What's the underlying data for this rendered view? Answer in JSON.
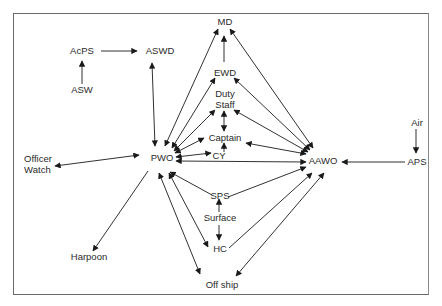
{
  "diagram": {
    "type": "communication-network",
    "nodes": [
      {
        "id": "MD",
        "label": "MD",
        "x": 225,
        "y": 22
      },
      {
        "id": "AcPS",
        "label": "AcPS",
        "x": 82,
        "y": 51
      },
      {
        "id": "ASWD",
        "label": "ASWD",
        "x": 160,
        "y": 51
      },
      {
        "id": "ASW",
        "label": "ASW",
        "x": 82,
        "y": 90
      },
      {
        "id": "EWD",
        "label": "EWD",
        "x": 225,
        "y": 73
      },
      {
        "id": "DutyStaff",
        "label": "Duty\nStaff",
        "x": 225,
        "y": 99
      },
      {
        "id": "Captain",
        "label": "Captain",
        "x": 225,
        "y": 137
      },
      {
        "id": "CY",
        "label": "CY",
        "x": 219,
        "y": 156
      },
      {
        "id": "PWO",
        "label": "PWO",
        "x": 162,
        "y": 157
      },
      {
        "id": "OfficerWatch",
        "label": "Officer\nWatch",
        "x": 36,
        "y": 165
      },
      {
        "id": "AAWO",
        "label": "AAWO",
        "x": 322,
        "y": 160
      },
      {
        "id": "Air",
        "label": "Air",
        "x": 417,
        "y": 123
      },
      {
        "id": "APS",
        "label": "APS",
        "x": 417,
        "y": 161
      },
      {
        "id": "SPS",
        "label": "SPS",
        "x": 220,
        "y": 195
      },
      {
        "id": "Surface",
        "label": "Surface",
        "x": 220,
        "y": 218
      },
      {
        "id": "HC",
        "label": "HC",
        "x": 220,
        "y": 248
      },
      {
        "id": "Harpoon",
        "label": "Harpoon",
        "x": 89,
        "y": 257
      },
      {
        "id": "OffShip",
        "label": "Off ship",
        "x": 222,
        "y": 285
      }
    ],
    "edges": [
      {
        "from": "ASW",
        "to": "AcPS",
        "dir": "forward"
      },
      {
        "from": "AcPS",
        "to": "ASWD",
        "dir": "forward"
      },
      {
        "from": "ASWD",
        "to": "PWO",
        "dir": "both"
      },
      {
        "from": "EWD",
        "to": "MD",
        "dir": "forward"
      },
      {
        "from": "MD",
        "to": "PWO",
        "dir": "both"
      },
      {
        "from": "MD",
        "to": "AAWO",
        "dir": "both"
      },
      {
        "from": "EWD",
        "to": "PWO",
        "dir": "both"
      },
      {
        "from": "EWD",
        "to": "AAWO",
        "dir": "both"
      },
      {
        "from": "DutyStaff",
        "to": "PWO",
        "dir": "both"
      },
      {
        "from": "DutyStaff",
        "to": "AAWO",
        "dir": "both"
      },
      {
        "from": "DutyStaff",
        "to": "Captain",
        "dir": "both"
      },
      {
        "from": "PWO",
        "to": "Captain",
        "dir": "both"
      },
      {
        "from": "Captain",
        "to": "AAWO",
        "dir": "both"
      },
      {
        "from": "CY",
        "to": "Captain",
        "dir": "forward"
      },
      {
        "from": "PWO",
        "to": "CY",
        "dir": "both"
      },
      {
        "from": "PWO",
        "to": "AAWO",
        "dir": "both"
      },
      {
        "from": "OfficerWatch",
        "to": "PWO",
        "dir": "both"
      },
      {
        "from": "PWO",
        "to": "Harpoon",
        "dir": "forward"
      },
      {
        "from": "SPS",
        "to": "PWO",
        "dir": "forward"
      },
      {
        "from": "SPS",
        "to": "AAWO",
        "dir": "forward"
      },
      {
        "from": "Surface",
        "to": "SPS",
        "dir": "forward"
      },
      {
        "from": "Surface",
        "to": "HC",
        "dir": "forward"
      },
      {
        "from": "PWO",
        "to": "HC",
        "dir": "both"
      },
      {
        "from": "HC",
        "to": "AAWO",
        "dir": "forward"
      },
      {
        "from": "PWO",
        "to": "OffShip",
        "dir": "both"
      },
      {
        "from": "OffShip",
        "to": "AAWO",
        "dir": "both"
      },
      {
        "from": "Air",
        "to": "APS",
        "dir": "forward"
      },
      {
        "from": "APS",
        "to": "AAWO",
        "dir": "forward"
      }
    ]
  },
  "labels": {
    "MD": "MD",
    "AcPS": "AcPS",
    "ASWD": "ASWD",
    "ASW": "ASW",
    "EWD": "EWD",
    "DutyStaff_1": "Duty",
    "DutyStaff_2": "Staff",
    "Captain": "Captain",
    "CY": "CY",
    "PWO": "PWO",
    "OfficerWatch_1": "Officer",
    "OfficerWatch_2": "Watch",
    "AAWO": "AAWO",
    "Air": "Air",
    "APS": "APS",
    "SPS": "SPS",
    "Surface": "Surface",
    "HC": "HC",
    "Harpoon": "Harpoon",
    "OffShip": "Off ship"
  },
  "colors": {
    "line": "#1a1a1a",
    "text": "#2a2a2a",
    "frame": "#6a6a6a",
    "background": "#ffffff"
  }
}
